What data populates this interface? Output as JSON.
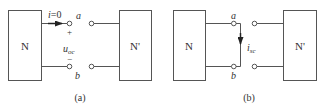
{
  "diagram": {
    "type": "circuit",
    "panels": [
      {
        "id": "a",
        "caption": "(a)",
        "left_network": "N",
        "right_network": "N'",
        "terminal_top": "a",
        "terminal_bottom": "b",
        "current_label_var": "i",
        "current_label_eq": "=0",
        "voltage_label_var": "u",
        "voltage_label_sub": "oc",
        "plus_sign": "+",
        "minus_sign": "−"
      },
      {
        "id": "b",
        "caption": "(b)",
        "left_network": "N",
        "right_network": "N'",
        "terminal_top": "a",
        "terminal_bottom": "b",
        "current_label_var": "i",
        "current_label_sub": "sc"
      }
    ]
  }
}
